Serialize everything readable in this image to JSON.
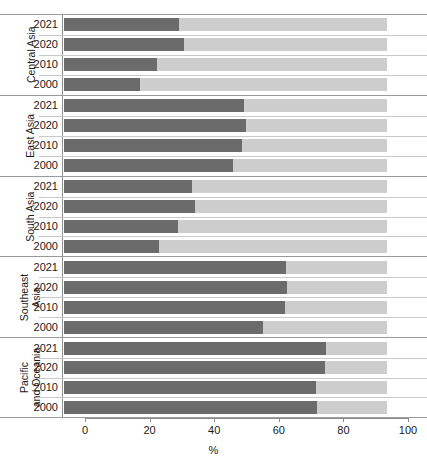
{
  "chart_data": {
    "type": "bar",
    "orientation": "horizontal",
    "stacked": true,
    "stacked_total": 100,
    "title": "",
    "xlabel": "%",
    "ylabel": "",
    "xlim": [
      0,
      100
    ],
    "xticks": [
      0,
      20,
      40,
      60,
      80,
      100
    ],
    "xtick_labels": [
      "0",
      "20",
      "40",
      "60",
      "80",
      "100"
    ],
    "grid": false,
    "legend_position": "none",
    "colors": {
      "series_primary": "#6b6b6b",
      "series_remainder": "#cdcdcd",
      "axis": "#8f8f8f",
      "separator": "#c9c9c9",
      "text": "#1a1a1a"
    },
    "categories": [
      "2021",
      "2020",
      "2010",
      "2000"
    ],
    "groups": [
      {
        "label": "Central Asia",
        "label_lines": "Central Asia",
        "rows": [
          {
            "year": "2021",
            "value": 35.5
          },
          {
            "year": "2020",
            "value": 37.0
          },
          {
            "year": "2010",
            "value": 28.8
          },
          {
            "year": "2000",
            "value": 23.6
          }
        ]
      },
      {
        "label": "East Asia",
        "label_lines": "East Asia",
        "rows": [
          {
            "year": "2021",
            "value": 55.8
          },
          {
            "year": "2020",
            "value": 56.5
          },
          {
            "year": "2010",
            "value": 55.0
          },
          {
            "year": "2000",
            "value": 52.2
          }
        ]
      },
      {
        "label": "South Asia",
        "label_lines": "South Asia",
        "rows": [
          {
            "year": "2021",
            "value": 39.5
          },
          {
            "year": "2020",
            "value": 40.7
          },
          {
            "year": "2010",
            "value": 35.4
          },
          {
            "year": "2000",
            "value": 29.5
          }
        ]
      },
      {
        "label": "Southeast Asia",
        "label_lines": "Southeast\nAsia",
        "rows": [
          {
            "year": "2021",
            "value": 68.6
          },
          {
            "year": "2020",
            "value": 69.0
          },
          {
            "year": "2010",
            "value": 68.3
          },
          {
            "year": "2000",
            "value": 61.5
          }
        ]
      },
      {
        "label": "Pacific and Oceania",
        "label_lines": "Pacific\nand Oceania",
        "rows": [
          {
            "year": "2021",
            "value": 81.0
          },
          {
            "year": "2020",
            "value": 80.7
          },
          {
            "year": "2010",
            "value": 78.0
          },
          {
            "year": "2000",
            "value": 78.4
          }
        ]
      }
    ]
  }
}
